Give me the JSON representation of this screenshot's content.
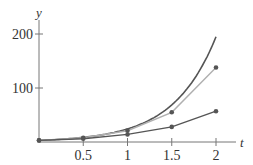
{
  "chart_data": {
    "type": "line",
    "title": "",
    "xlabel": "t",
    "ylabel": "y",
    "xlim": [
      0,
      2.2
    ],
    "ylim": [
      0,
      210
    ],
    "x_ticks": [
      "0.5",
      "1",
      "1.5",
      "2"
    ],
    "y_ticks": [
      "100",
      "200"
    ],
    "grid": false,
    "legend": null,
    "series": [
      {
        "name": "exact solution curve",
        "style": "smooth",
        "color": "#555555",
        "x": [
          0,
          0.25,
          0.5,
          0.75,
          1,
          1.25,
          1.5,
          1.75,
          2
        ],
        "values": [
          3,
          5,
          9,
          15,
          24,
          40,
          68,
          115,
          195
        ]
      },
      {
        "name": "approximation (finer step)",
        "style": "points-line",
        "color": "#b0b0b0",
        "x": [
          0,
          0.5,
          1,
          1.5,
          2
        ],
        "values": [
          3,
          8,
          21,
          55,
          138
        ]
      },
      {
        "name": "approximation (coarser step)",
        "style": "points-line",
        "color": "#555555",
        "x": [
          0,
          0.5,
          1,
          1.5,
          2
        ],
        "values": [
          3,
          6,
          14,
          28,
          57
        ]
      }
    ]
  },
  "labels": {
    "x": "t",
    "y": "y",
    "xt": [
      "0.5",
      "1",
      "1.5",
      "2"
    ],
    "yt": [
      "100",
      "200"
    ]
  }
}
